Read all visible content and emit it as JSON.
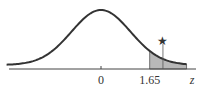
{
  "chart_data": {
    "type": "area",
    "title": "",
    "xlabel": "z",
    "ylabel": "",
    "xlim": [
      -3.2,
      2.9
    ],
    "distribution": "standard-normal",
    "tick_labels": [
      "0",
      "1.65"
    ],
    "ticks": [
      0,
      1.65
    ],
    "shaded_region": {
      "from": 1.65,
      "to": 2.9,
      "color": "#b8b8b8"
    },
    "marker": {
      "x": 2.1,
      "symbol": "★",
      "description": "test statistic marker above shaded tail"
    },
    "grid": false,
    "legend": "none",
    "colors": {
      "curve": "#333333",
      "axis": "#444444",
      "fill": "#b8b8b8"
    }
  }
}
